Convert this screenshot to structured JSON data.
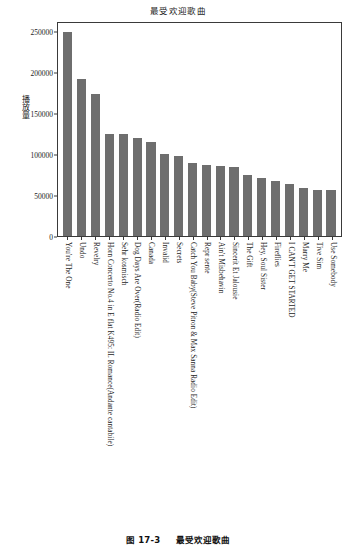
{
  "figure": {
    "caption_number": "图 17-3",
    "caption_text": "最受欢迎歌曲"
  },
  "chart_data": {
    "type": "bar",
    "title": "最受欢迎歌曲",
    "xlabel": "",
    "ylabel": "播放量",
    "ylim": [
      0,
      262000
    ],
    "grid": false,
    "legend": "none",
    "ytick_labels": [
      "0",
      "50000",
      "100000",
      "150000",
      "200000",
      "250000"
    ],
    "ytick_values": [
      0,
      50000,
      100000,
      150000,
      200000,
      250000
    ],
    "categories": [
      "You're The One",
      "Undo",
      "Revelry",
      "Horn Concerto No.4 in E flat K495: II. Romance(Andante cantabile)",
      "Sehr kosmisch",
      "Dog Days Are Over(Radio Edit)",
      "Canada",
      "Invalid",
      "Secrets",
      "Catch You Baby(Steve Pitron & Max Sanna Radio Edit)",
      "Repr sente",
      "Ain't Misbehavin",
      "Sincerit Et Jalousie",
      "The Gift",
      "Hey, Soul Sister",
      "Fireflies",
      "I CAN'T GET STARTED",
      "Marry Me",
      "Tive Sim",
      "Use Somebody"
    ],
    "values": [
      249000,
      191000,
      173000,
      124500,
      124500,
      119500,
      114000,
      100000,
      97000,
      89000,
      86500,
      85000,
      83500,
      74000,
      70500,
      66500,
      63000,
      58500,
      56500,
      56500
    ],
    "bar_color": "#6e6e6e",
    "axis_color": "#3a3a3a"
  }
}
